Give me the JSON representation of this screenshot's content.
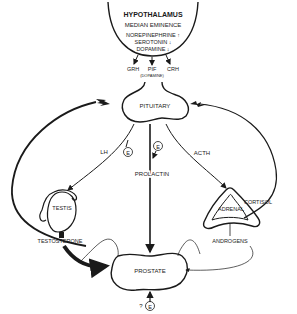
{
  "hypothalamus": {
    "title": "HYPOTHALAMUS",
    "subtitle": "MEDIAN EMINENCE",
    "neurotransmitters": [
      "NOREPINEPHRINE ↑",
      "SEROTONIN ↓",
      "DOPAMINE ↓"
    ]
  },
  "releasing_factors": {
    "grh": "GRH",
    "pif": "PIF",
    "pif_note": "(DOPAMINE)",
    "crh": "CRH"
  },
  "organs": {
    "pituitary": "PITUITARY",
    "testis": "TESTIS",
    "adrenal": "ADRENAL",
    "prostate": "PROSTATE"
  },
  "hormones": {
    "lh": "LH",
    "prolactin": "PROLACTIN",
    "acth": "ACTH",
    "testosterone": "TESTOSTERONE",
    "androgens": "ANDROGENS",
    "cortisol": "CORTISOL"
  },
  "estrogen_markers": {
    "symbol": "E",
    "prostate_question": "?"
  }
}
